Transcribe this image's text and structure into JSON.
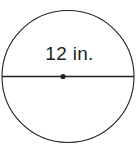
{
  "figure": {
    "kind": "geometry-diagram",
    "shape": "circle",
    "background_color": "#ffffff",
    "stroke_color": "#231f20",
    "stroke_width": 1.1,
    "label": "12 in.",
    "label_value": 12,
    "label_unit": "in.",
    "label_measures": "diameter",
    "circle": {
      "center_x": 68,
      "center_y": 76.5,
      "radius": 66,
      "left_edge_x": 2,
      "right_edge_x": 134,
      "top_edge_y": 10.5,
      "bottom_edge_y": 142.5
    },
    "diameter_line": {
      "x1": 2,
      "y1": 76.5,
      "x2": 134,
      "y2": 76.5
    },
    "center_point": {
      "x": 63,
      "y": 76.5,
      "radius": 2.6,
      "fill": "#231f20"
    }
  }
}
